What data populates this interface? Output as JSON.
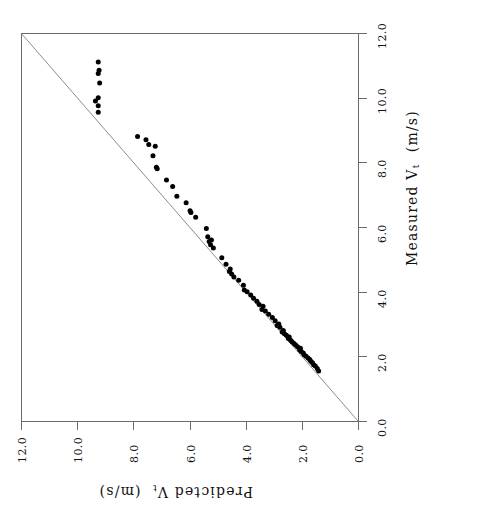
{
  "figure": {
    "orientation": "rotated-90-ccw",
    "background": "#ffffff",
    "axis_color": "#6b6b6b",
    "point_color": "#000000",
    "refline_color": "#8d8d8d",
    "top_artifact": ""
  },
  "axes": {
    "measured": {
      "title_main": "Measured V",
      "title_sub": "t",
      "title_units": "(m/s)",
      "full_label": "Measured V_t (m/s)",
      "ticks": [
        "0.0",
        "2.0",
        "4.0",
        "6.0",
        "8.0",
        "10.0",
        "12.0"
      ],
      "range": [
        0.0,
        12.0
      ],
      "position": "right-vertical"
    },
    "predicted": {
      "title_main": "Predicted V",
      "title_sub": "t",
      "title_units": "(m/s)",
      "full_label": "Predicted V_t (m/s)",
      "ticks": [
        "12.0",
        "10.0",
        "8.0",
        "6.0",
        "4.0",
        "2.0",
        "0.0"
      ],
      "range": [
        0.0,
        12.0
      ],
      "position": "bottom-horizontal"
    }
  },
  "chart_data": {
    "type": "scatter",
    "title": "",
    "subtitle": "",
    "xlabel": "Measured V_t (m/s)",
    "ylabel": "Predicted V_t (m/s)",
    "xlim": [
      0.0,
      12.0
    ],
    "ylim": [
      0.0,
      12.0
    ],
    "grid": false,
    "legend": null,
    "annotations": [
      {
        "kind": "reference-line",
        "label": "1:1 line",
        "from": [
          0.0,
          0.0
        ],
        "to": [
          12.0,
          12.0
        ]
      }
    ],
    "series": [
      {
        "name": "Measured vs Predicted terminal velocity",
        "marker": "filled-circle",
        "marker_size_px": 5,
        "color": "#000000",
        "points": [
          [
            1.55,
            1.4
          ],
          [
            1.62,
            1.45
          ],
          [
            1.7,
            1.52
          ],
          [
            1.74,
            1.58
          ],
          [
            1.8,
            1.62
          ],
          [
            1.85,
            1.68
          ],
          [
            1.9,
            1.72
          ],
          [
            1.95,
            1.78
          ],
          [
            2.0,
            1.85
          ],
          [
            2.05,
            1.92
          ],
          [
            2.1,
            1.95
          ],
          [
            2.15,
            2.02
          ],
          [
            2.2,
            2.08
          ],
          [
            2.25,
            2.05
          ],
          [
            2.3,
            2.15
          ],
          [
            2.35,
            2.22
          ],
          [
            2.4,
            2.28
          ],
          [
            2.45,
            2.35
          ],
          [
            2.5,
            2.4
          ],
          [
            2.55,
            2.48
          ],
          [
            2.6,
            2.45
          ],
          [
            2.65,
            2.55
          ],
          [
            2.7,
            2.62
          ],
          [
            2.75,
            2.7
          ],
          [
            2.8,
            2.66
          ],
          [
            2.9,
            2.78
          ],
          [
            2.95,
            2.88
          ],
          [
            3.0,
            2.82
          ],
          [
            3.1,
            2.95
          ],
          [
            3.2,
            3.05
          ],
          [
            3.3,
            3.18
          ],
          [
            3.4,
            3.3
          ],
          [
            3.45,
            3.42
          ],
          [
            3.55,
            3.38
          ],
          [
            3.6,
            3.52
          ],
          [
            3.7,
            3.6
          ],
          [
            3.8,
            3.72
          ],
          [
            3.9,
            3.82
          ],
          [
            4.0,
            3.95
          ],
          [
            4.05,
            4.05
          ],
          [
            4.2,
            4.08
          ],
          [
            4.35,
            4.25
          ],
          [
            4.45,
            4.42
          ],
          [
            4.55,
            4.5
          ],
          [
            4.62,
            4.58
          ],
          [
            4.7,
            4.55
          ],
          [
            4.85,
            4.7
          ],
          [
            5.05,
            4.85
          ],
          [
            5.35,
            5.15
          ],
          [
            5.45,
            5.25
          ],
          [
            5.55,
            5.3
          ],
          [
            5.6,
            5.22
          ],
          [
            5.7,
            5.35
          ],
          [
            5.95,
            5.4
          ],
          [
            6.3,
            5.78
          ],
          [
            6.45,
            5.95
          ],
          [
            6.5,
            5.98
          ],
          [
            6.75,
            6.12
          ],
          [
            6.95,
            6.45
          ],
          [
            7.25,
            6.6
          ],
          [
            7.45,
            6.82
          ],
          [
            7.8,
            7.15
          ],
          [
            7.85,
            7.18
          ],
          [
            8.2,
            7.3
          ],
          [
            8.5,
            7.22
          ],
          [
            8.55,
            7.45
          ],
          [
            8.7,
            7.55
          ],
          [
            8.8,
            7.85
          ],
          [
            9.55,
            9.25
          ],
          [
            9.75,
            9.25
          ],
          [
            9.9,
            9.35
          ],
          [
            10.0,
            9.25
          ],
          [
            10.45,
            9.2
          ],
          [
            10.75,
            9.25
          ],
          [
            10.85,
            9.22
          ],
          [
            11.1,
            9.25
          ]
        ]
      }
    ]
  }
}
